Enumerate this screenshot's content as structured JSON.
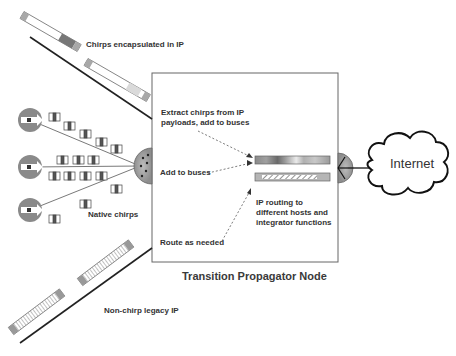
{
  "diagram": {
    "title": "Transition Propagator Node",
    "labels": {
      "chirps_encapsulated": "Chirps encapsulated in IP",
      "extract_chirps": "Extract chirps from IP\npayloads, add to buses",
      "add_to_buses": "Add to buses",
      "ip_routing": "IP routing to\ndifferent hosts and\nintegrator functions",
      "route_as_needed": "Route as needed",
      "native_chirps": "Native chirps",
      "non_chirp_legacy": "Non-chirp legacy IP",
      "internet": "Internet"
    },
    "nodes": [
      {
        "id": "source-1",
        "type": "chirp-source"
      },
      {
        "id": "source-2",
        "type": "chirp-source"
      },
      {
        "id": "source-3",
        "type": "chirp-source"
      },
      {
        "id": "ingress-hub",
        "type": "hub"
      },
      {
        "id": "egress-hub",
        "type": "hub"
      },
      {
        "id": "chirp-bus",
        "type": "bus"
      },
      {
        "id": "ip-bus",
        "type": "bus"
      },
      {
        "id": "internet-cloud",
        "type": "cloud"
      }
    ],
    "colors": {
      "node_fill": "#8a8a8a",
      "line": "#222222",
      "box_border": "#555555",
      "text": "#333333"
    }
  }
}
